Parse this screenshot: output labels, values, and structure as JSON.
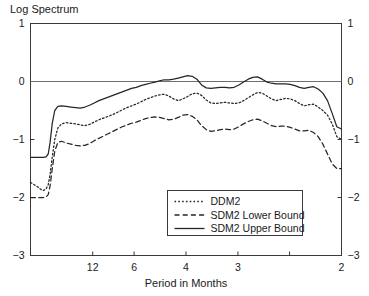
{
  "chart_data": {
    "type": "line",
    "title": "Log Spectrum",
    "xlabel": "Period in Months",
    "ylabel": "",
    "grid": false,
    "legend_position": "bottom-center-inside",
    "ylim": [
      -3,
      1
    ],
    "y_ticks": [
      "1",
      "0",
      "-1",
      "-2",
      "-3"
    ],
    "y_tick_values": [
      1,
      0,
      -1,
      -2,
      -3
    ],
    "x_axis_note": "Period in months, decreasing left to right (frequency increasing)",
    "x_tick_labels": [
      "12",
      "6",
      "4",
      "3",
      "",
      "2"
    ],
    "x_tick_positions": [
      0.2,
      0.333,
      0.5,
      0.667,
      0.833,
      1.0
    ],
    "zero_reference_line": 0,
    "series": [
      {
        "name": "DDM2",
        "style": "dotted",
        "x": [
          0.0,
          0.012,
          0.024,
          0.033,
          0.042,
          0.05,
          0.057,
          0.063,
          0.07,
          0.078,
          0.088,
          0.1,
          0.115,
          0.13,
          0.145,
          0.16,
          0.175,
          0.19,
          0.205,
          0.22,
          0.235,
          0.25,
          0.265,
          0.28,
          0.295,
          0.31,
          0.325,
          0.34,
          0.355,
          0.37,
          0.385,
          0.4,
          0.415,
          0.43,
          0.445,
          0.46,
          0.475,
          0.49,
          0.505,
          0.52,
          0.535,
          0.55,
          0.565,
          0.58,
          0.595,
          0.61,
          0.625,
          0.64,
          0.655,
          0.67,
          0.685,
          0.7,
          0.715,
          0.73,
          0.745,
          0.76,
          0.775,
          0.79,
          0.805,
          0.82,
          0.835,
          0.85,
          0.865,
          0.88,
          0.895,
          0.91,
          0.925,
          0.94,
          0.955,
          0.97,
          0.985,
          1.0
        ],
        "y": [
          -1.74,
          -1.78,
          -1.82,
          -1.86,
          -1.88,
          -1.85,
          -1.78,
          -1.6,
          -1.3,
          -1.0,
          -0.8,
          -0.73,
          -0.71,
          -0.72,
          -0.73,
          -0.75,
          -0.76,
          -0.74,
          -0.7,
          -0.66,
          -0.63,
          -0.6,
          -0.57,
          -0.53,
          -0.49,
          -0.45,
          -0.42,
          -0.39,
          -0.35,
          -0.31,
          -0.28,
          -0.25,
          -0.23,
          -0.22,
          -0.25,
          -0.3,
          -0.33,
          -0.3,
          -0.26,
          -0.21,
          -0.2,
          -0.24,
          -0.32,
          -0.37,
          -0.38,
          -0.37,
          -0.36,
          -0.37,
          -0.38,
          -0.37,
          -0.33,
          -0.28,
          -0.23,
          -0.19,
          -0.2,
          -0.25,
          -0.3,
          -0.33,
          -0.31,
          -0.29,
          -0.3,
          -0.33,
          -0.38,
          -0.42,
          -0.4,
          -0.39,
          -0.44,
          -0.5,
          -0.58,
          -0.73,
          -0.95,
          -1.0
        ]
      },
      {
        "name": "SDM2 Lower Bound",
        "style": "dashed",
        "x": [
          0.0,
          0.012,
          0.024,
          0.033,
          0.042,
          0.05,
          0.057,
          0.063,
          0.07,
          0.078,
          0.088,
          0.1,
          0.115,
          0.13,
          0.145,
          0.16,
          0.175,
          0.19,
          0.205,
          0.22,
          0.235,
          0.25,
          0.265,
          0.28,
          0.295,
          0.31,
          0.325,
          0.34,
          0.355,
          0.37,
          0.385,
          0.4,
          0.415,
          0.43,
          0.445,
          0.46,
          0.475,
          0.49,
          0.505,
          0.52,
          0.535,
          0.55,
          0.565,
          0.58,
          0.595,
          0.61,
          0.625,
          0.64,
          0.655,
          0.67,
          0.685,
          0.7,
          0.715,
          0.73,
          0.745,
          0.76,
          0.775,
          0.79,
          0.805,
          0.82,
          0.835,
          0.85,
          0.865,
          0.88,
          0.895,
          0.91,
          0.925,
          0.94,
          0.955,
          0.97,
          0.985,
          1.0
        ],
        "y": [
          -2.0,
          -2.0,
          -2.0,
          -2.0,
          -2.0,
          -1.99,
          -1.95,
          -1.8,
          -1.5,
          -1.2,
          -1.05,
          -1.03,
          -1.06,
          -1.08,
          -1.1,
          -1.11,
          -1.1,
          -1.07,
          -1.02,
          -0.98,
          -0.94,
          -0.9,
          -0.86,
          -0.82,
          -0.78,
          -0.75,
          -0.72,
          -0.7,
          -0.67,
          -0.64,
          -0.62,
          -0.61,
          -0.62,
          -0.64,
          -0.66,
          -0.65,
          -0.62,
          -0.58,
          -0.57,
          -0.6,
          -0.66,
          -0.76,
          -0.83,
          -0.86,
          -0.85,
          -0.83,
          -0.82,
          -0.83,
          -0.82,
          -0.78,
          -0.73,
          -0.69,
          -0.66,
          -0.65,
          -0.68,
          -0.72,
          -0.76,
          -0.78,
          -0.77,
          -0.77,
          -0.79,
          -0.82,
          -0.85,
          -0.85,
          -0.84,
          -0.88,
          -0.95,
          -1.08,
          -1.25,
          -1.42,
          -1.5,
          -1.5
        ]
      },
      {
        "name": "SDM2 Upper Bound",
        "style": "solid",
        "x": [
          0.0,
          0.012,
          0.024,
          0.033,
          0.042,
          0.05,
          0.057,
          0.063,
          0.07,
          0.078,
          0.088,
          0.1,
          0.115,
          0.13,
          0.145,
          0.16,
          0.175,
          0.19,
          0.205,
          0.22,
          0.235,
          0.25,
          0.265,
          0.28,
          0.295,
          0.31,
          0.325,
          0.34,
          0.355,
          0.37,
          0.385,
          0.4,
          0.415,
          0.43,
          0.445,
          0.46,
          0.475,
          0.49,
          0.505,
          0.52,
          0.535,
          0.55,
          0.565,
          0.58,
          0.595,
          0.61,
          0.625,
          0.64,
          0.655,
          0.67,
          0.685,
          0.7,
          0.715,
          0.73,
          0.745,
          0.76,
          0.775,
          0.79,
          0.805,
          0.82,
          0.835,
          0.85,
          0.865,
          0.88,
          0.895,
          0.91,
          0.925,
          0.94,
          0.955,
          0.97,
          0.985,
          1.0
        ],
        "y": [
          -1.31,
          -1.31,
          -1.31,
          -1.31,
          -1.31,
          -1.3,
          -1.25,
          -1.05,
          -0.72,
          -0.5,
          -0.43,
          -0.42,
          -0.43,
          -0.44,
          -0.45,
          -0.46,
          -0.44,
          -0.41,
          -0.37,
          -0.33,
          -0.3,
          -0.27,
          -0.24,
          -0.21,
          -0.18,
          -0.15,
          -0.12,
          -0.1,
          -0.07,
          -0.05,
          -0.03,
          -0.01,
          0.01,
          0.03,
          0.03,
          0.04,
          0.06,
          0.08,
          0.1,
          0.09,
          0.04,
          -0.06,
          -0.11,
          -0.12,
          -0.11,
          -0.1,
          -0.1,
          -0.11,
          -0.1,
          -0.06,
          -0.01,
          0.04,
          0.07,
          0.08,
          0.04,
          -0.01,
          -0.03,
          -0.04,
          -0.04,
          -0.04,
          -0.05,
          -0.07,
          -0.1,
          -0.12,
          -0.1,
          -0.09,
          -0.13,
          -0.2,
          -0.33,
          -0.55,
          -0.78,
          -0.82
        ]
      }
    ]
  },
  "legend": {
    "items": [
      {
        "label": "DDM2",
        "style": "dotted"
      },
      {
        "label": "SDM2 Lower Bound",
        "style": "dashed"
      },
      {
        "label": "SDM2 Upper Bound",
        "style": "solid"
      }
    ]
  }
}
